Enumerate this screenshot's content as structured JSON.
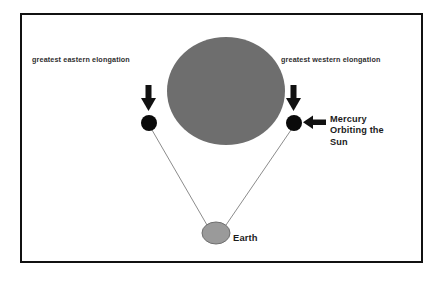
{
  "diagram": {
    "frame": {
      "border_color": "#111111"
    },
    "background_color": "#ffffff",
    "labels": {
      "eastern_elongation": "greatest eastern elongation",
      "western_elongation": "greatest western elongation",
      "mercury": "Mercury Orbiting the Sun",
      "earth": "Earth"
    },
    "bodies": [
      {
        "name": "sun",
        "shape": "ellipse",
        "color": "#6e6e6e",
        "cx": 226,
        "cy": 91,
        "rx": 59,
        "ry": 54
      },
      {
        "name": "mercury-east",
        "shape": "circle",
        "color": "#000000",
        "cx": 149,
        "cy": 123,
        "r": 8
      },
      {
        "name": "mercury-west",
        "shape": "circle",
        "color": "#000000",
        "cx": 294,
        "cy": 123,
        "r": 8
      },
      {
        "name": "earth",
        "shape": "ellipse",
        "color": "#9a9a9a",
        "outline": "#6f6f6f",
        "cx": 216,
        "cy": 233,
        "rx": 14,
        "ry": 11
      }
    ],
    "sight_lines": [
      {
        "name": "earth-to-east-mercury",
        "color": "#8c8c8c",
        "x1": 207,
        "y1": 225,
        "x2": 152,
        "y2": 130
      },
      {
        "name": "earth-to-west-mercury",
        "color": "#8c8c8c",
        "x1": 226,
        "y1": 225,
        "x2": 291,
        "y2": 130
      }
    ],
    "arrows": [
      {
        "name": "arrow-down-east",
        "direction": "down",
        "color": "#111111"
      },
      {
        "name": "arrow-down-west",
        "direction": "down",
        "color": "#111111"
      },
      {
        "name": "arrow-left-mercury-label",
        "direction": "left",
        "color": "#111111"
      }
    ]
  }
}
